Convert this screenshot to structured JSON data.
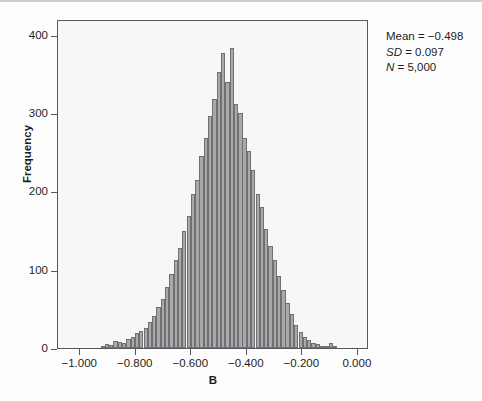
{
  "figure": {
    "background_color": "#fdfdfd",
    "plot_background_color": "#f7f7f7",
    "frame_color": "#55585c",
    "bar_fill_color": "#a9a9a9",
    "bar_edge_color": "#6e7073"
  },
  "annotation": {
    "mean_label": "Mean = −0.498",
    "sd_prefix": "SD",
    "sd_value": " = 0.097",
    "n_prefix": "N",
    "n_value": " = 5,000"
  },
  "chart_data": {
    "type": "bar",
    "title": "",
    "subtitle": "",
    "xlabel": "B",
    "ylabel": "Frequency",
    "xlim": [
      -1.08,
      0.04
    ],
    "ylim": [
      0,
      420
    ],
    "grid": false,
    "legend": null,
    "xticks": [
      -1.0,
      -0.8,
      -0.6,
      -0.4,
      -0.2,
      0.0
    ],
    "xtick_labels": [
      "−1.000",
      "−0.800",
      "−0.600",
      "−0.400",
      "−0.200",
      "0.000"
    ],
    "yticks": [
      0,
      100,
      200,
      300,
      400
    ],
    "ytick_labels": [
      "0",
      "100",
      "200",
      "300",
      "400"
    ],
    "bin_width": 0.0155,
    "statistics": {
      "mean": -0.498,
      "sd": 0.097,
      "n": 5000
    },
    "bin_centers": [
      -1.012,
      -0.997,
      -0.981,
      -0.966,
      -0.95,
      -0.935,
      -0.919,
      -0.904,
      -0.888,
      -0.873,
      -0.857,
      -0.842,
      -0.826,
      -0.811,
      -0.795,
      -0.78,
      -0.764,
      -0.749,
      -0.733,
      -0.718,
      -0.702,
      -0.687,
      -0.671,
      -0.656,
      -0.64,
      -0.625,
      -0.609,
      -0.594,
      -0.578,
      -0.563,
      -0.547,
      -0.532,
      -0.516,
      -0.501,
      -0.485,
      -0.47,
      -0.454,
      -0.439,
      -0.423,
      -0.408,
      -0.392,
      -0.377,
      -0.361,
      -0.346,
      -0.33,
      -0.315,
      -0.299,
      -0.284,
      -0.268,
      -0.253,
      -0.237,
      -0.222,
      -0.206,
      -0.191,
      -0.175,
      -0.16,
      -0.144,
      -0.129,
      -0.113,
      -0.098,
      -0.082,
      -0.067,
      -0.051,
      -0.036,
      -0.02,
      -0.005
    ],
    "values": [
      0,
      0,
      0,
      0,
      0,
      0,
      3,
      5,
      4,
      9,
      8,
      7,
      11,
      14,
      19,
      22,
      26,
      33,
      41,
      52,
      63,
      78,
      95,
      112,
      128,
      150,
      168,
      196,
      214,
      245,
      268,
      296,
      318,
      352,
      377,
      340,
      383,
      311,
      300,
      268,
      251,
      227,
      196,
      180,
      152,
      130,
      112,
      92,
      74,
      58,
      44,
      30,
      20,
      14,
      10,
      7,
      5,
      3,
      2,
      6,
      1,
      0,
      0,
      0,
      0,
      0
    ]
  }
}
